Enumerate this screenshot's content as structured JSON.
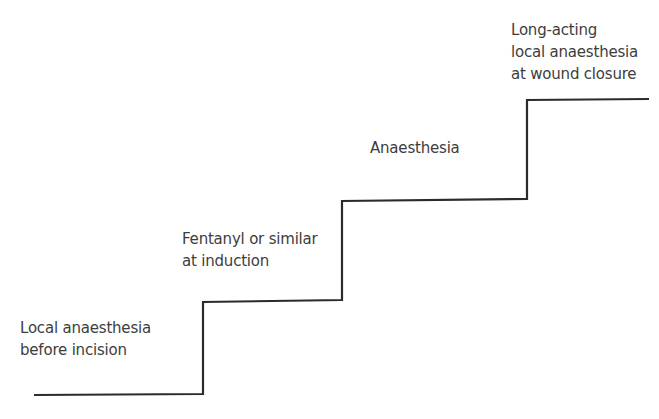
{
  "diagram": {
    "type": "staircase",
    "line_color": "#2b2b2b",
    "text_color": "#3d3d3d",
    "steps": [
      {
        "lines": [
          "Local anaesthesia",
          "before incision"
        ]
      },
      {
        "lines": [
          "Fentanyl or similar",
          "at induction"
        ]
      },
      {
        "lines": [
          "Anaesthesia"
        ]
      },
      {
        "lines": [
          "Long-acting",
          "local anaesthesia",
          "at wound closure"
        ]
      }
    ]
  }
}
